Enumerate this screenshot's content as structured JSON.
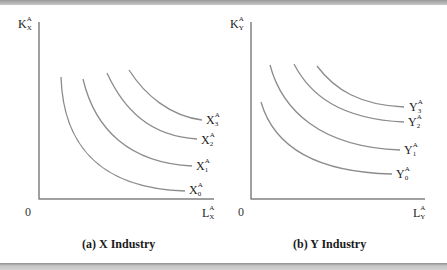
{
  "figure": {
    "panels": [
      {
        "id": "a",
        "caption": "(a)  X Industry",
        "origin_label": "0",
        "y_axis": {
          "base": "K",
          "sup": "A",
          "sub": "X"
        },
        "x_axis": {
          "base": "L",
          "sup": "A",
          "sub": "X"
        },
        "curves": [
          {
            "base": "X",
            "sup": "A",
            "sub": "0"
          },
          {
            "base": "X",
            "sup": "A",
            "sub": "1"
          },
          {
            "base": "X",
            "sup": "A",
            "sub": "2"
          },
          {
            "base": "X",
            "sup": "A",
            "sub": "3"
          }
        ]
      },
      {
        "id": "b",
        "caption": "(b)  Y Industry",
        "origin_label": "0",
        "y_axis": {
          "base": "K",
          "sup": "A",
          "sub": "Y"
        },
        "x_axis": {
          "base": "L",
          "sup": "A",
          "sub": "Y"
        },
        "curves": [
          {
            "base": "Y",
            "sup": "A",
            "sub": "0"
          },
          {
            "base": "Y",
            "sup": "A",
            "sub": "1"
          },
          {
            "base": "Y",
            "sup": "A",
            "sub": "2"
          },
          {
            "base": "Y",
            "sup": "A",
            "sub": "3"
          }
        ]
      }
    ],
    "colors": {
      "axis": "#808080",
      "curve": "#8c8c8c",
      "text": "#222222",
      "band": "#a8a8a8"
    }
  }
}
